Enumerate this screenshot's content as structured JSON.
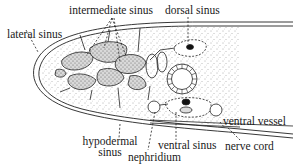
{
  "diagram": {
    "type": "anatomical cross-section",
    "labels": {
      "intermediate_sinus": "intermediate sinus",
      "dorsal_sinus": "dorsal sinus",
      "lateral_sinus": "lateral sinus",
      "hypodermal_sinus_line1": "hypodermal",
      "hypodermal_sinus_line2": "sinus",
      "nephridium": "nephridium",
      "ventral_sinus": "ventral sinus",
      "ventral_vessel": "ventral vessel",
      "nerve_cord": "nerve cord"
    },
    "caption_partial": "Fig. 4 Section..."
  }
}
